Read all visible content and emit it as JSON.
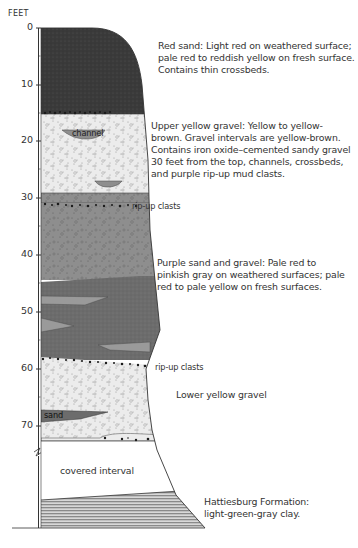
{
  "figure": {
    "axis_title": "FEET",
    "axis_ticks": [
      {
        "label": "0",
        "y": 28
      },
      {
        "label": "10",
        "y": 85
      },
      {
        "label": "20",
        "y": 141
      },
      {
        "label": "30",
        "y": 198
      },
      {
        "label": "40",
        "y": 255
      },
      {
        "label": "50",
        "y": 312
      },
      {
        "label": "60",
        "y": 369
      },
      {
        "label": "70",
        "y": 426
      }
    ],
    "inline_labels": {
      "channel": "channel",
      "sand": "sand",
      "rip_up_clasts_upper": "rip-up clasts",
      "rip_up_clasts_lower": "rip-up clasts",
      "covered_interval": "covered interval"
    },
    "units": [
      {
        "name": "red-sand",
        "lines": [
          "Red sand: Light red on weathered surface;",
          "pale red to reddish yellow on fresh surface.",
          "Contains thin crossbeds."
        ]
      },
      {
        "name": "upper-yellow-gravel",
        "lines": [
          "Upper yellow gravel: Yellow to yellow-",
          "brown. Gravel intervals are yellow-brown.",
          "Contains iron oxide–cemented sandy gravel",
          "30 feet from the top, channels, crossbeds,",
          "and purple rip-up mud clasts."
        ]
      },
      {
        "name": "purple-sand-and-gravel",
        "lines": [
          "Purple sand and gravel: Pale red to",
          "pinkish gray on weathered surfaces; pale",
          "red to pale yellow on fresh surfaces."
        ]
      },
      {
        "name": "lower-yellow-gravel",
        "lines": [
          "Lower yellow gravel"
        ]
      },
      {
        "name": "hattiesburg-formation",
        "lines": [
          "Hattiesburg Formation:",
          "light-green-gray clay."
        ]
      }
    ],
    "colors": {
      "red_sand": "#3a3a3a",
      "yellow_gravel": "#ebebeb",
      "purple_upper": "#8e8e8e",
      "purple_lower": "#6c6c6c",
      "lens_light": "#a8a8a8",
      "covered": "#ffffff",
      "clay_stripe": "#9a9a9a",
      "outline": "#333333",
      "clast": "#1a1a1a"
    }
  }
}
